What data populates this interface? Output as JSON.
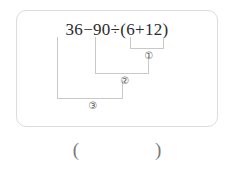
{
  "problem": {
    "expression": "36−90÷(6+12)",
    "expression_parts": {
      "operand_1": "36",
      "operator_1": "−",
      "operand_2": "90",
      "operator_2": "÷",
      "open_paren": "(",
      "operand_3": "6",
      "operator_3": "+",
      "operand_4": "12",
      "close_paren": ")"
    },
    "step_markers": [
      {
        "label": "①",
        "step": 1,
        "covers": "(6+12)"
      },
      {
        "label": "②",
        "step": 2,
        "covers": "90÷(6+12)"
      },
      {
        "label": "③",
        "step": 3,
        "covers": "36−90÷(6+12)"
      }
    ],
    "answer_blank": "(                )",
    "answer_blank_open": "(",
    "answer_blank_close": ")",
    "answer_value": ""
  },
  "style": {
    "text_color": "#2b2b2b",
    "marker_color": "#5a5a5a",
    "bracket_color": "#c9c9c9",
    "card_border_color": "#dcdcdc",
    "blank_color": "#787878",
    "background_color": "#ffffff"
  },
  "diagram": {
    "type": "order-of-operations-brackets",
    "brackets": [
      {
        "id": "bracket-1",
        "x1": 130,
        "x2": 163,
        "y_top": 37,
        "y_line": 48,
        "label": "①"
      },
      {
        "id": "bracket-2",
        "x1": 95,
        "x2": 148,
        "y_top": 37,
        "y_line": 73,
        "label": "②"
      },
      {
        "id": "bracket-3",
        "x1": 57,
        "x2": 122,
        "y_top": 37,
        "y_line": 98,
        "label": "③"
      }
    ]
  }
}
